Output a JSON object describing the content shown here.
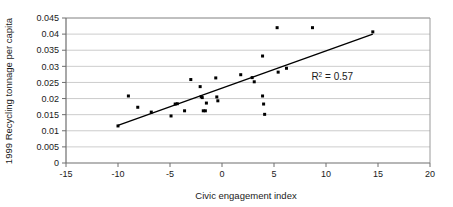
{
  "chart_data": {
    "type": "scatter",
    "title": "",
    "xlabel": "Civic engagement index",
    "ylabel": "1999 Recycling tonnage per capita",
    "xlim": [
      -15,
      20
    ],
    "ylim": [
      0,
      0.045
    ],
    "xticks": [
      "-15",
      "-10",
      "-5",
      "0",
      "5",
      "10",
      "15",
      "20"
    ],
    "xtick_values": [
      -15,
      -10,
      -5,
      0,
      5,
      10,
      15,
      20
    ],
    "yticks": [
      "0",
      "0.005",
      "0.01",
      "0.015",
      "0.02",
      "0.025",
      "0.03",
      "0.035",
      "0.04",
      "0.045"
    ],
    "ytick_values": [
      0,
      0.005,
      0.01,
      0.015,
      0.02,
      0.025,
      0.03,
      0.035,
      0.04,
      0.045
    ],
    "grid": "horizontal",
    "legend": "none",
    "marker_color": "#000000",
    "trendline_color": "#000000",
    "gridline_color": "#bfbfbf",
    "axis_color": "#808080",
    "series": [
      {
        "name": "Municipalities",
        "marker": "square",
        "points": [
          [
            -10.0,
            0.0115
          ],
          [
            -9.0,
            0.0208
          ],
          [
            -8.1,
            0.0173
          ],
          [
            -6.8,
            0.0158
          ],
          [
            -4.9,
            0.0146
          ],
          [
            -4.5,
            0.0183
          ],
          [
            -4.3,
            0.0184
          ],
          [
            -3.6,
            0.0162
          ],
          [
            -3.0,
            0.0259
          ],
          [
            -2.1,
            0.0237
          ],
          [
            -2.0,
            0.0206
          ],
          [
            -1.9,
            0.0203
          ],
          [
            -1.8,
            0.0162
          ],
          [
            -1.6,
            0.0162
          ],
          [
            -1.5,
            0.0186
          ],
          [
            -0.6,
            0.0264
          ],
          [
            -0.5,
            0.0205
          ],
          [
            -0.4,
            0.0193
          ],
          [
            1.8,
            0.0274
          ],
          [
            2.9,
            0.0265
          ],
          [
            3.1,
            0.0252
          ],
          [
            3.9,
            0.0332
          ],
          [
            3.9,
            0.0208
          ],
          [
            4.0,
            0.0183
          ],
          [
            4.1,
            0.0151
          ],
          [
            5.3,
            0.042
          ],
          [
            5.4,
            0.0282
          ],
          [
            6.2,
            0.0294
          ],
          [
            8.7,
            0.042
          ],
          [
            14.5,
            0.0407
          ]
        ]
      }
    ],
    "trendline": {
      "x_start": -10.0,
      "y_start": 0.0117,
      "x_end": 14.5,
      "y_end": 0.04
    },
    "annotations": [
      {
        "name": "r-squared",
        "prefix": "R",
        "superscript": "2",
        "suffix": " = 0.57",
        "x": 10.6,
        "y": 0.0257
      }
    ]
  }
}
